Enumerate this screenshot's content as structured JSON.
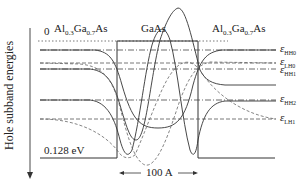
{
  "figure": {
    "y_axis_label": "Hole subband energies",
    "zero_label": "0",
    "barrier_depth_label": "0.128 eV",
    "width_label": "100 A",
    "regions": {
      "left_barrier": {
        "base": "Al",
        "sub1": "0.3",
        "mid": "Ga",
        "sub2": "0.7",
        "tail": "As"
      },
      "well": "GaAs",
      "right_barrier": {
        "base": "Al",
        "sub1": "0.3",
        "mid": "Ga",
        "sub2": "0.7",
        "tail": "As"
      }
    },
    "levels": [
      {
        "symbol": "ε",
        "sub": "HH0",
        "y": 50,
        "style": "solid"
      },
      {
        "symbol": "ε",
        "sub": "LH0",
        "y": 63,
        "style": "dashed"
      },
      {
        "symbol": "ε",
        "sub": "HH1",
        "y": 69,
        "style": "solid"
      },
      {
        "symbol": "ε",
        "sub": "HH2",
        "y": 100,
        "style": "solid"
      },
      {
        "symbol": "ε",
        "sub": "LH1",
        "y": 119,
        "style": "dashed"
      }
    ],
    "colors": {
      "line": "#333333",
      "dashed": "#666666",
      "background": "#ffffff"
    }
  }
}
